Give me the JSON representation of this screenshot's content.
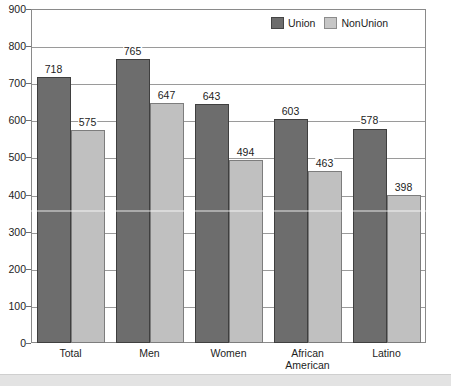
{
  "chart_data": {
    "type": "bar",
    "title": "",
    "subtitle": "",
    "xlabel": "",
    "ylabel": "",
    "ylim": [
      0,
      900
    ],
    "ytick_step": 100,
    "yticks": [
      0,
      100,
      200,
      300,
      400,
      500,
      600,
      700,
      800,
      900
    ],
    "ytick_labels": [
      "0",
      "100",
      "200",
      "300",
      "400",
      "500",
      "600",
      "700",
      "800",
      "900"
    ],
    "grid": true,
    "grid_axis": "y",
    "legend_position": "top-right",
    "categories": [
      "Total",
      "Men",
      "Women",
      "African American",
      "Latino"
    ],
    "category_label_lines": [
      [
        "Total"
      ],
      [
        "Men"
      ],
      [
        "Women"
      ],
      [
        "African",
        "American"
      ],
      [
        "Latino"
      ]
    ],
    "series": [
      {
        "name": "Union",
        "color": "#6d6d6d",
        "values": [
          718,
          765,
          643,
          603,
          578
        ]
      },
      {
        "name": "NonUnion",
        "color": "#c0c0c0",
        "values": [
          575,
          647,
          494,
          463,
          398
        ]
      }
    ],
    "data_labels": [
      {
        "category": "Total",
        "series": "Union",
        "value": 718,
        "text": "718"
      },
      {
        "category": "Total",
        "series": "NonUnion",
        "value": 575,
        "text": "575"
      },
      {
        "category": "Men",
        "series": "Union",
        "value": 765,
        "text": "765"
      },
      {
        "category": "Men",
        "series": "NonUnion",
        "value": 647,
        "text": "647"
      },
      {
        "category": "Women",
        "series": "Union",
        "value": 643,
        "text": "643"
      },
      {
        "category": "Women",
        "series": "NonUnion",
        "value": 494,
        "text": "494"
      },
      {
        "category": "African American",
        "series": "Union",
        "value": 603,
        "text": "603"
      },
      {
        "category": "African American",
        "series": "NonUnion",
        "value": 463,
        "text": "463"
      },
      {
        "category": "Latino",
        "series": "Union",
        "value": 578,
        "text": "578"
      },
      {
        "category": "Latino",
        "series": "NonUnion",
        "value": 398,
        "text": "398"
      }
    ]
  },
  "legend": {
    "items": [
      {
        "label": "Union",
        "swatch": "union-swatch"
      },
      {
        "label": "NonUnion",
        "swatch": "nonunion-swatch"
      }
    ]
  },
  "colors": {
    "union": "#6d6d6d",
    "nonunion": "#c0c0c0",
    "gridline": "#9a9a9a",
    "frame": "#8a8a8a",
    "text": "#1d1d1d",
    "page_band": "#e3e3e3"
  }
}
